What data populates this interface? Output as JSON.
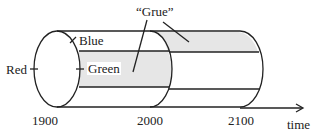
{
  "diagram": {
    "title": "“Grue”",
    "labels": {
      "red": "Red",
      "blue": "Blue",
      "green": "Green",
      "grue": "“Grue”"
    },
    "axis": {
      "ticks": [
        "1900",
        "2000",
        "2100"
      ],
      "label": "time"
    },
    "colors": {
      "stroke": "#222222",
      "shade": "#e6e6e6",
      "background": "#ffffff"
    }
  }
}
